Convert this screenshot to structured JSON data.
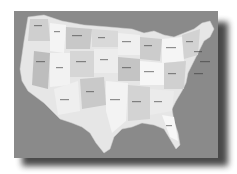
{
  "heading": {
    "text": "",
    "note": "Heading clipped at top edge; only descenders visible, text not legible"
  },
  "map": {
    "subject": "United States (contiguous) political map with state and city labels",
    "style": "grayscale",
    "labels_legible": false,
    "colors": {
      "ocean": "#8a8a8a",
      "land_light": "#f2f2f2",
      "land_mid": "#d4d4d4",
      "land_dark": "#bdbdbd",
      "label": "#3a3a3a",
      "shadow": "#2a2a2a",
      "page": "#ffffff"
    }
  }
}
